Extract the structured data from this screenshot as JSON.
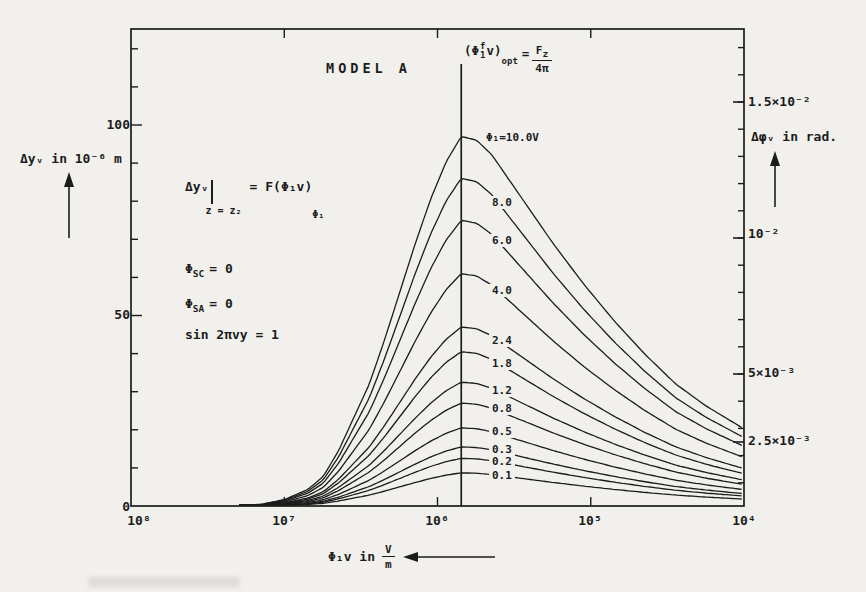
{
  "figure": {
    "background_color": "#f1f0ec",
    "ink_color": "#1c1c1c"
  },
  "chart_data": {
    "type": "line",
    "title": "MODEL A",
    "x_axis": {
      "label_prefix": "Φ₁v in",
      "frac_num": "V",
      "frac_den": "m",
      "scale": "log",
      "direction": "decreasing-right",
      "arrow": "left",
      "decade_labels": [
        "10⁸",
        "10⁷",
        "10⁶",
        "10⁵",
        "10⁴"
      ],
      "decade_values": [
        100000000,
        10000000,
        1000000,
        100000,
        10000
      ]
    },
    "y_left_axis": {
      "label": "Δyᵥ in 10⁻⁶ m",
      "scale": "linear",
      "range": [
        0,
        125
      ],
      "arrow": "up",
      "tick_labels": [
        "0",
        "50",
        "100"
      ],
      "tick_values": [
        0,
        50,
        100
      ],
      "minor_step": 10
    },
    "y_right_axis": {
      "label": "Δφᵥ in rad.",
      "scale": "linear",
      "range": [
        0,
        0.0175
      ],
      "arrow": "up",
      "tick_labels": [
        "2.5×10⁻³",
        "5×10⁻³",
        "10⁻²",
        "1.5×10⁻²"
      ],
      "tick_values": [
        0.0025,
        0.005,
        0.01,
        0.015
      ],
      "minor_step": 0.001
    },
    "optimum_line": {
      "x_value_v_per_m": 700000,
      "label_text": "(Φ₁ᶠ v)opt = Fz / 4π"
    },
    "series": [
      {
        "label": "Φ₁=10.0V",
        "phi1_volts": 10.0,
        "peak_dy_1e6m": 97.0,
        "label_y": 131
      },
      {
        "label": "8.0",
        "phi1_volts": 8.0,
        "peak_dy_1e6m": 86.0,
        "label_y": 196
      },
      {
        "label": "6.0",
        "phi1_volts": 6.0,
        "peak_dy_1e6m": 75.0,
        "label_y": 234
      },
      {
        "label": "4.0",
        "phi1_volts": 4.0,
        "peak_dy_1e6m": 61.0,
        "label_y": 284
      },
      {
        "label": "2.4",
        "phi1_volts": 2.4,
        "peak_dy_1e6m": 47.0,
        "label_y": 334
      },
      {
        "label": "1.8",
        "phi1_volts": 1.8,
        "peak_dy_1e6m": 40.5,
        "label_y": 357
      },
      {
        "label": "1.2",
        "phi1_volts": 1.2,
        "peak_dy_1e6m": 32.5,
        "label_y": 384
      },
      {
        "label": "0.8",
        "phi1_volts": 0.8,
        "peak_dy_1e6m": 27.0,
        "label_y": 402
      },
      {
        "label": "0.5",
        "phi1_volts": 0.5,
        "peak_dy_1e6m": 20.5,
        "label_y": 425
      },
      {
        "label": "0.3",
        "phi1_volts": 0.3,
        "peak_dy_1e6m": 15.5,
        "label_y": 443
      },
      {
        "label": "0.2",
        "phi1_volts": 0.2,
        "peak_dy_1e6m": 12.5,
        "label_y": 455
      },
      {
        "label": "0.1",
        "phi1_volts": 0.1,
        "peak_dy_1e6m": 8.7,
        "label_y": 469
      }
    ],
    "shape_profile_decades_vs_fraction": [
      [
        -1.45,
        0.0
      ],
      [
        -1.3,
        0.005
      ],
      [
        -1.15,
        0.018
      ],
      [
        -1.0,
        0.045
      ],
      [
        -0.9,
        0.08
      ],
      [
        -0.8,
        0.15
      ],
      [
        -0.7,
        0.24
      ],
      [
        -0.6,
        0.33
      ],
      [
        -0.5,
        0.45
      ],
      [
        -0.4,
        0.58
      ],
      [
        -0.3,
        0.71
      ],
      [
        -0.2,
        0.83
      ],
      [
        -0.1,
        0.93
      ],
      [
        0.0,
        1.0
      ],
      [
        0.1,
        0.99
      ],
      [
        0.2,
        0.95
      ],
      [
        0.3,
        0.89
      ],
      [
        0.4,
        0.83
      ],
      [
        0.6,
        0.71
      ],
      [
        0.8,
        0.6
      ],
      [
        1.0,
        0.5
      ],
      [
        1.2,
        0.41
      ],
      [
        1.4,
        0.33
      ],
      [
        1.6,
        0.27
      ],
      [
        1.84,
        0.21
      ]
    ]
  },
  "annotations": {
    "definition": {
      "lhs": "Δyᵥ",
      "condition": "z = z₂",
      "rhs": "= F(Φ₁v)",
      "rhs_sub": "Φ₁"
    },
    "phi_sc": {
      "base": "Φ",
      "sub": "SC",
      "rest": "= 0"
    },
    "phi_sa": {
      "base": "Φ",
      "sub": "SA",
      "rest": "= 0"
    },
    "sin_condition": "sin 2πvy = 1",
    "opt": {
      "open": "(Φ",
      "sup": "f",
      "sub": "1",
      "close": "v)",
      "subscript": "opt",
      "eq": "=",
      "num_base": "F",
      "num_sub": "z",
      "den": "4π"
    }
  }
}
